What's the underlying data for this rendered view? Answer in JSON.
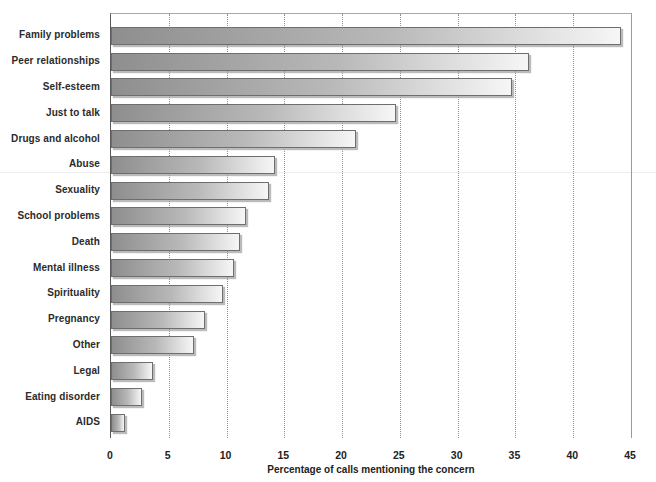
{
  "chart_data": {
    "type": "bar",
    "orientation": "horizontal",
    "title": "",
    "xlabel": "Percentage of calls mentioning the concern",
    "ylabel": "",
    "xlim": [
      0,
      45
    ],
    "x_ticks": [
      0,
      5,
      10,
      15,
      20,
      25,
      30,
      35,
      40,
      45
    ],
    "grid": "vertical-dotted",
    "legend": "none",
    "categories": [
      "Family problems",
      "Peer relationships",
      "Self-esteem",
      "Just to talk",
      "Drugs and alcohol",
      "Abuse",
      "Sexuality",
      "School problems",
      "Death",
      "Mental illness",
      "Spirituality",
      "Pregnancy",
      "Other",
      "Legal",
      "Eating disorder",
      "AIDS"
    ],
    "values": [
      44,
      36,
      34.5,
      24.5,
      21,
      14,
      13.5,
      11.5,
      11,
      10.5,
      9.5,
      8,
      7,
      3.5,
      2.5,
      1
    ],
    "colors": {
      "bar_gradient_start": "#8e8e8e",
      "bar_gradient_end": "#f6f6f6",
      "bar_border": "#6e6e6e",
      "gridline": "#8f8f8f",
      "axis_line": "#5a5a5a",
      "text": "#222222",
      "background": "#ffffff"
    }
  }
}
